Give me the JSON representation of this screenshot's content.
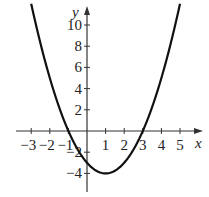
{
  "chart_data": {
    "type": "line",
    "title": "",
    "function": "y = x^2 - 2x - 3",
    "xlabel": "x",
    "ylabel": "y",
    "xlim": [
      -3.8,
      6
    ],
    "ylim": [
      -5.5,
      12
    ],
    "grid": false,
    "legend": null,
    "x_ticks": [
      -3,
      -2,
      -1,
      1,
      2,
      3,
      4,
      5
    ],
    "x_tick_labels": [
      "−3",
      "−2",
      "−1",
      "1",
      "2",
      "3",
      "4",
      "5"
    ],
    "y_ticks": [
      10,
      8,
      6,
      4,
      2,
      -2,
      -4
    ],
    "y_tick_labels": [
      "10",
      "8",
      "6",
      "4",
      "2",
      "−2",
      "−4"
    ],
    "series": [
      {
        "name": "parabola",
        "x": [
          -3,
          -2,
          -1,
          0,
          1,
          2,
          3,
          4,
          5
        ],
        "y": [
          12,
          5,
          0,
          -3,
          -4,
          -3,
          0,
          5,
          12
        ]
      }
    ],
    "annotations": {
      "vertex": [
        1,
        -4
      ],
      "x_intercepts": [
        -1,
        3
      ],
      "y_intercept": -3
    }
  },
  "axes": {
    "x_label": "x",
    "y_label": "y"
  }
}
